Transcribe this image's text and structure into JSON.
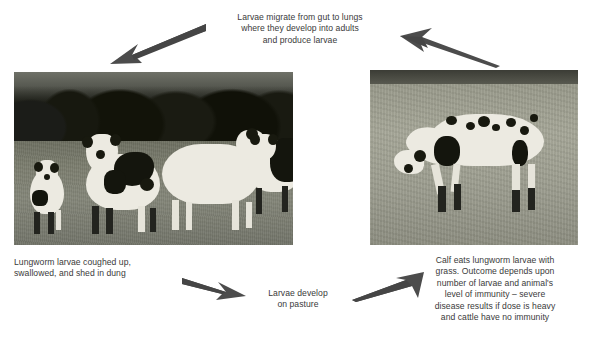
{
  "diagram": {
    "arrow_color": "#4a4a4a",
    "text_color": "#3a3a3a"
  },
  "labels": {
    "top": "Larvae migrate from gut to lungs\nwhere they develop into adults\nand produce larvae",
    "bottom_left": "Lungworm larvae coughed up,\nswallowed, and shed in dung",
    "center": "Larvae develop\non pasture",
    "bottom_right": "Calf eats lungworm larvae with\ngrass. Outcome depends upon\nnumber of larvae and animal's\nlevel of immunity – severe\ndisease results if dose is heavy\nand cattle have no immunity",
    "footer_cropped": ""
  },
  "photos": {
    "left": {
      "caption_role": "herd-of-cattle-in-pasture-with-treeline",
      "alt": "Group of white cattle with black markings standing in a grass field in front of a dark treeline"
    },
    "right": {
      "caption_role": "single-calf-grazing",
      "alt": "A white calf with black spots grazing head-down in an open pasture"
    }
  },
  "arrows": [
    {
      "name": "arrow-to-left-photo",
      "direction": "down-left"
    },
    {
      "name": "arrow-from-right-photo",
      "direction": "up-left"
    },
    {
      "name": "arrow-to-pasture",
      "direction": "down-right"
    },
    {
      "name": "arrow-to-right-photo",
      "direction": "up-right"
    }
  ]
}
